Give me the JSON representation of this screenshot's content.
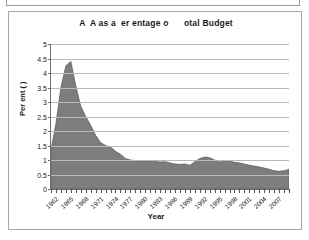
{
  "chart_data": {
    "type": "area",
    "title": "A  A as a  er entage o      otal Budget",
    "xlabel": "Year",
    "ylabel": "Per ent ( )",
    "ylim": [
      0,
      5
    ],
    "ytick_step": 0.5,
    "yticks": [
      "5",
      "4.5",
      "4",
      "3.5",
      "3",
      "2.5",
      "2",
      "1.5",
      "1",
      "0.5",
      "0"
    ],
    "grid": true,
    "legend": "none",
    "xlim": [
      1962,
      2010
    ],
    "xtick_labels": [
      "1962",
      "1965",
      "1968",
      "1971",
      "1974",
      "1977",
      "1980",
      "1983",
      "1986",
      "1989",
      "1992",
      "1995",
      "1998",
      "2001",
      "2004",
      "2007"
    ],
    "xtick_step": 3,
    "series_color": "#7d7d7d",
    "categories": [
      1962,
      1963,
      1964,
      1965,
      1966,
      1967,
      1968,
      1969,
      1970,
      1971,
      1972,
      1973,
      1974,
      1975,
      1976,
      1977,
      1978,
      1979,
      1980,
      1981,
      1982,
      1983,
      1984,
      1985,
      1986,
      1987,
      1988,
      1989,
      1990,
      1991,
      1992,
      1993,
      1994,
      1995,
      1996,
      1997,
      1998,
      1999,
      2000,
      2001,
      2002,
      2003,
      2004,
      2005,
      2006,
      2007,
      2008,
      2009,
      2010
    ],
    "values": [
      1.35,
      2.25,
      3.5,
      4.25,
      4.4,
      3.55,
      2.85,
      2.5,
      2.2,
      1.85,
      1.6,
      1.5,
      1.45,
      1.3,
      1.2,
      1.05,
      1.0,
      0.98,
      0.97,
      0.97,
      0.96,
      0.95,
      0.93,
      0.94,
      0.9,
      0.86,
      0.85,
      0.86,
      0.82,
      0.94,
      1.05,
      1.1,
      1.08,
      1.0,
      0.93,
      0.96,
      0.96,
      0.92,
      0.9,
      0.86,
      0.82,
      0.79,
      0.76,
      0.72,
      0.68,
      0.63,
      0.61,
      0.63,
      0.68
    ]
  },
  "axis_titles": {
    "y": "Per ent ( )",
    "x": "Year"
  }
}
